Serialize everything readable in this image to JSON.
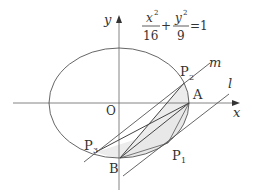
{
  "diagram": {
    "equation": {
      "x_num": "x",
      "x_exp": "2",
      "x_den": "16",
      "plus": "+",
      "y_num": "y",
      "y_exp": "2",
      "y_den": "9",
      "equals": "=1"
    },
    "axes": {
      "x_label": "x",
      "y_label": "y",
      "origin_label": "O"
    },
    "points": {
      "A": "A",
      "B": "B",
      "P1_main": "P",
      "P1_sub": "1",
      "P2_main": "P",
      "P2_sub": "2",
      "P3_main": "P",
      "P3_sub": "3"
    },
    "lines": {
      "m": "m",
      "l": "l"
    },
    "colors": {
      "stroke": "#555555",
      "shade": "#e6e6e6",
      "text": "#333333"
    }
  }
}
